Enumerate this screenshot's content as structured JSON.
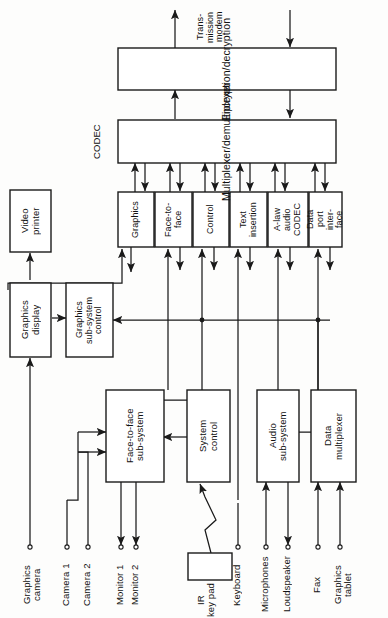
{
  "figure": {
    "kind": "block-diagram",
    "orientation": "rotated-90-ccw"
  },
  "top": {
    "encryption": "Encryption/decryption",
    "multiplexer": "Multiplexer/demultiplexer",
    "codec_group_label": "CODEC",
    "transmission_modem": "Trans-\nmission\nmodem"
  },
  "codec_modules": [
    {
      "id": "graphics",
      "label": "Graphics"
    },
    {
      "id": "face-to-face",
      "label": "Face-to-\nface"
    },
    {
      "id": "control",
      "label": "Control"
    },
    {
      "id": "text-insertion",
      "label": "Text\ninsertion"
    },
    {
      "id": "a-law-audio-codec",
      "label": "A-law\naudio\nCODEC"
    },
    {
      "id": "data-port-interface",
      "label": "Data\nport\ninter-\nface"
    }
  ],
  "left_blocks": {
    "video_printer": "Video\nprinter",
    "graphics_display": "Graphics\ndisplay",
    "graphics_subsystem_control": "Graphics\nsub-system\ncontrol"
  },
  "lower_blocks": [
    {
      "id": "face-to-face-subsystem",
      "label": "Face-to-face\nsub-system"
    },
    {
      "id": "system-control",
      "label": "System\ncontrol"
    },
    {
      "id": "audio-subsystem",
      "label": "Audio\nsub-system"
    },
    {
      "id": "data-multiplexer",
      "label": "Data\nmultiplexer"
    }
  ],
  "peripherals": [
    {
      "id": "graphics-camera",
      "label": "Graphics\ncamera"
    },
    {
      "id": "camera-1",
      "label": "Camera 1"
    },
    {
      "id": "camera-2",
      "label": "Camera 2"
    },
    {
      "id": "monitor-1",
      "label": "Monitor 1"
    },
    {
      "id": "monitor-2",
      "label": "Monitor 2"
    },
    {
      "id": "ir-key-pad",
      "label": "IR\nkey pad"
    },
    {
      "id": "keyboard",
      "label": "Keyboard"
    },
    {
      "id": "microphones",
      "label": "Microphones"
    },
    {
      "id": "loudspeaker",
      "label": "Loudspeaker"
    },
    {
      "id": "fax",
      "label": "Fax"
    },
    {
      "id": "graphics-tablet",
      "label": "Graphics\ntablet"
    }
  ],
  "colors": {
    "line": "#1a1a1a",
    "text": "#111111",
    "background": "#fdfdfc"
  }
}
